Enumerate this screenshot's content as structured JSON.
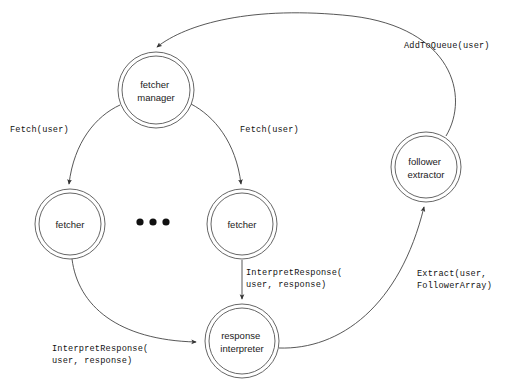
{
  "diagram": {
    "background_color": "#ffffff",
    "stroke_color": "#555555",
    "text_color": "#111111",
    "nodes": [
      {
        "id": "fetcher-manager",
        "line1": "fetcher",
        "line2": "manager",
        "cx": 156,
        "cy": 90,
        "r_outer": 38,
        "r_inner": 34
      },
      {
        "id": "fetcher-left",
        "line1": "fetcher",
        "line2": "",
        "cx": 70,
        "cy": 224,
        "r_outer": 35,
        "r_inner": 31
      },
      {
        "id": "fetcher-right",
        "line1": "fetcher",
        "line2": "",
        "cx": 242,
        "cy": 224,
        "r_outer": 35,
        "r_inner": 31
      },
      {
        "id": "response-interpreter",
        "line1": "response",
        "line2": "interpreter",
        "cx": 242,
        "cy": 341,
        "r_outer": 37,
        "r_inner": 33
      },
      {
        "id": "follower-extractor",
        "line1": "follower",
        "line2": "extractor",
        "cx": 426,
        "cy": 167,
        "r_outer": 35,
        "r_inner": 31
      }
    ],
    "ellipsis": {
      "dots": 3,
      "cx": 153,
      "cy": 222,
      "r": 3.6
    },
    "edges": [
      {
        "id": "edge-add-to-queue",
        "from": "follower-extractor",
        "to": "fetcher-manager",
        "label_lines": [
          "AddToQueue(user)"
        ],
        "label_x": 404,
        "label_y": 48
      },
      {
        "id": "edge-fetch-left",
        "from": "fetcher-manager",
        "to": "fetcher-left",
        "label_lines": [
          "Fetch(user)"
        ],
        "label_x": 10,
        "label_y": 132
      },
      {
        "id": "edge-fetch-right",
        "from": "fetcher-manager",
        "to": "fetcher-right",
        "label_lines": [
          "Fetch(user)"
        ],
        "label_x": 240,
        "label_y": 132
      },
      {
        "id": "edge-interpret-right",
        "from": "fetcher-right",
        "to": "response-interpreter",
        "label_lines": [
          "InterpretResponse(",
          "  user, response)"
        ],
        "label_x": 246,
        "label_y": 275
      },
      {
        "id": "edge-interpret-left",
        "from": "fetcher-left",
        "to": "response-interpreter",
        "label_lines": [
          "InterpretResponse(",
          "  user, response)"
        ],
        "label_x": 52,
        "label_y": 351
      },
      {
        "id": "edge-extract",
        "from": "response-interpreter",
        "to": "follower-extractor",
        "label_lines": [
          "Extract(user,",
          "  FollowerArray)"
        ],
        "label_x": 417,
        "label_y": 276
      }
    ]
  }
}
